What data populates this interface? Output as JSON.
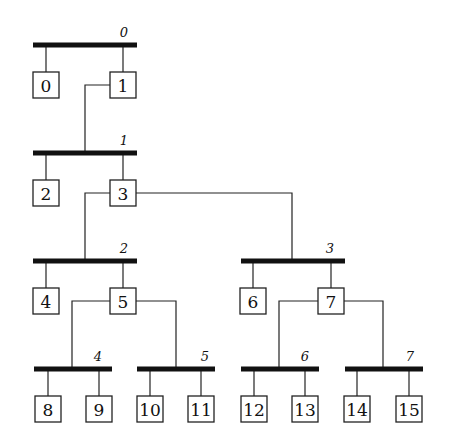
{
  "diagram": {
    "colors": {
      "ink": "#111111",
      "background": "#ffffff"
    },
    "buses": [
      {
        "id": "0",
        "label": "0",
        "x1": 33,
        "x2": 137,
        "y": 45,
        "label_x": 124,
        "label_y": 37
      },
      {
        "id": "1",
        "label": "1",
        "x1": 33,
        "x2": 137,
        "y": 153,
        "label_x": 124,
        "label_y": 145
      },
      {
        "id": "2",
        "label": "2",
        "x1": 33,
        "x2": 137,
        "y": 261,
        "label_x": 124,
        "label_y": 253
      },
      {
        "id": "3",
        "label": "3",
        "x1": 241,
        "x2": 345,
        "y": 261,
        "label_x": 330,
        "label_y": 253
      },
      {
        "id": "4",
        "label": "4",
        "x1": 34,
        "x2": 112,
        "y": 369,
        "label_x": 98,
        "label_y": 361
      },
      {
        "id": "5",
        "label": "5",
        "x1": 137,
        "x2": 215,
        "y": 369,
        "label_x": 205,
        "label_y": 361
      },
      {
        "id": "6",
        "label": "6",
        "x1": 241,
        "x2": 319,
        "y": 369,
        "label_x": 305,
        "label_y": 361
      },
      {
        "id": "7",
        "label": "7",
        "x1": 345,
        "x2": 423,
        "y": 369,
        "label_x": 410,
        "label_y": 361
      }
    ],
    "nodes": [
      {
        "id": "0",
        "label": "0",
        "x": 33,
        "y": 72,
        "bus": "0"
      },
      {
        "id": "1",
        "label": "1",
        "x": 110,
        "y": 72,
        "bus": "0"
      },
      {
        "id": "2",
        "label": "2",
        "x": 33,
        "y": 180,
        "bus": "1"
      },
      {
        "id": "3",
        "label": "3",
        "x": 110,
        "y": 180,
        "bus": "1"
      },
      {
        "id": "4",
        "label": "4",
        "x": 33,
        "y": 288,
        "bus": "2"
      },
      {
        "id": "5",
        "label": "5",
        "x": 110,
        "y": 288,
        "bus": "2"
      },
      {
        "id": "6",
        "label": "6",
        "x": 240,
        "y": 288,
        "bus": "3"
      },
      {
        "id": "7",
        "label": "7",
        "x": 318,
        "y": 288,
        "bus": "3"
      },
      {
        "id": "8",
        "label": "8",
        "x": 35,
        "y": 396,
        "bus": "4"
      },
      {
        "id": "9",
        "label": "9",
        "x": 86,
        "y": 396,
        "bus": "4"
      },
      {
        "id": "10",
        "label": "10",
        "x": 137,
        "y": 396,
        "bus": "5"
      },
      {
        "id": "11",
        "label": "11",
        "x": 188,
        "y": 396,
        "bus": "5"
      },
      {
        "id": "12",
        "label": "12",
        "x": 241,
        "y": 396,
        "bus": "6"
      },
      {
        "id": "13",
        "label": "13",
        "x": 292,
        "y": 396,
        "bus": "6"
      },
      {
        "id": "14",
        "label": "14",
        "x": 344,
        "y": 396,
        "bus": "7"
      },
      {
        "id": "15",
        "label": "15",
        "x": 396,
        "y": 396,
        "bus": "7"
      }
    ],
    "box_size": 26,
    "links": [
      {
        "from_node": "1",
        "to_bus": "1",
        "points": "110,85 85,85 85,153"
      },
      {
        "from_node": "3",
        "to_bus": "2",
        "points": "110,193 85,193 85,261"
      },
      {
        "from_node": "3",
        "to_bus": "3",
        "points": "136,193 292,193 292,261"
      },
      {
        "from_node": "5",
        "to_bus": "4",
        "points": "110,301 72,301 72,369"
      },
      {
        "from_node": "5",
        "to_bus": "5",
        "points": "136,301 176,301 176,369"
      },
      {
        "from_node": "7",
        "to_bus": "6",
        "points": "318,301 279,301 279,369"
      },
      {
        "from_node": "7",
        "to_bus": "7",
        "points": "344,301 383,301 383,369"
      }
    ]
  }
}
